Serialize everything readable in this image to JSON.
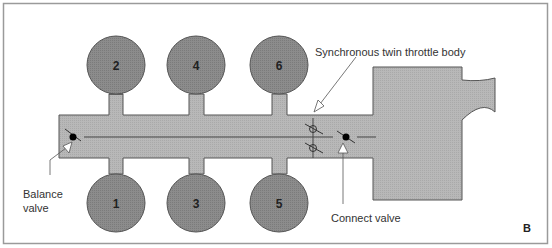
{
  "figure": {
    "panel_label": "B",
    "colors": {
      "background": "#ffffff",
      "frame": "#9a9a9a",
      "manifold_fill": "#b5b5b5",
      "manifold_stroke": "#555555",
      "cylinder_fill": "#8a8a8a",
      "cylinder_stroke": "#555555",
      "line": "#444444",
      "label_text": "#333333",
      "valve_closed": "#000000"
    }
  },
  "cylinders": {
    "top": [
      {
        "number": "2",
        "cx": 116,
        "cy": 65
      },
      {
        "number": "4",
        "cx": 196,
        "cy": 65
      },
      {
        "number": "6",
        "cx": 279,
        "cy": 65
      }
    ],
    "bottom": [
      {
        "number": "1",
        "cx": 116,
        "cy": 203
      },
      {
        "number": "3",
        "cx": 196,
        "cy": 203
      },
      {
        "number": "5",
        "cx": 279,
        "cy": 203
      }
    ]
  },
  "labels": {
    "throttle_body": "Synchronous twin throttle body",
    "balance_valve_line1": "Balance",
    "balance_valve_line2": "valve",
    "connect_valve": "Connect valve"
  }
}
